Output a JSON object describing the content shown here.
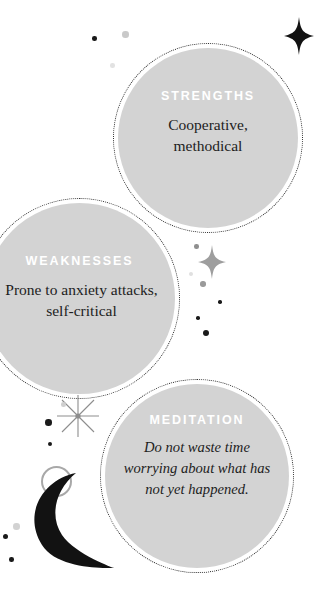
{
  "canvas": {
    "width": 318,
    "height": 590,
    "background": "#ffffff"
  },
  "theme": {
    "bubble_fill": "#d3d3d3",
    "bubble_ring": "#2b2b2b",
    "heading_color": "#ffffff",
    "body_color": "#1d1d1d",
    "ink_black": "#121212",
    "grey_mid": "#a8a8a8",
    "grey_light": "#d9d9d9"
  },
  "bubbles": [
    {
      "id": "strengths",
      "heading": "STRENGTHS",
      "body_line1": "Cooperative,",
      "body_line2": "methodical",
      "style": "roman"
    },
    {
      "id": "weaknesses",
      "heading": "WEAKNESSES",
      "body_line1": "Prone to anxiety attacks,",
      "body_line2": "self-critical",
      "style": "roman"
    },
    {
      "id": "meditation",
      "heading": "MEDITATION",
      "body_line1": "Do not waste time",
      "body_line2": "worrying about what has",
      "body_line3": "not yet happened.",
      "style": "italic"
    }
  ],
  "decorations": {
    "sparkle_top_right": "four-point-star-icon",
    "sparkle_mid_right": "four-point-star-icon",
    "starburst_lower_left": "eight-point-starburst-icon",
    "crescent": "crescent-moon-icon",
    "ring": "circle-outline-icon",
    "dots": [
      {
        "x": 92,
        "y": 36,
        "size": 4.5,
        "color": "#1a1a1a"
      },
      {
        "x": 122,
        "y": 31,
        "size": 6.5,
        "color": "#c9c9c9"
      },
      {
        "x": 110,
        "y": 63,
        "size": 4.5,
        "color": "#e2e2e2"
      },
      {
        "x": 194,
        "y": 244,
        "size": 4.5,
        "color": "#8f8f8f"
      },
      {
        "x": 189,
        "y": 272,
        "size": 4.0,
        "color": "#e0e0e0"
      },
      {
        "x": 200,
        "y": 281,
        "size": 5.5,
        "color": "#9a9a9a"
      },
      {
        "x": 218,
        "y": 300,
        "size": 3.5,
        "color": "#1a1a1a"
      },
      {
        "x": 196,
        "y": 316,
        "size": 3.5,
        "color": "#1a1a1a"
      },
      {
        "x": 203,
        "y": 330,
        "size": 6.0,
        "color": "#1a1a1a"
      },
      {
        "x": 61,
        "y": 402,
        "size": 4.5,
        "color": "#cfcfcf"
      },
      {
        "x": 45,
        "y": 419,
        "size": 6.5,
        "color": "#1a1a1a"
      },
      {
        "x": 48,
        "y": 442,
        "size": 4.0,
        "color": "#1a1a1a"
      },
      {
        "x": 13,
        "y": 523,
        "size": 6.5,
        "color": "#d2d2d2"
      },
      {
        "x": 3,
        "y": 534,
        "size": 5.0,
        "color": "#1a1a1a"
      },
      {
        "x": 9,
        "y": 557,
        "size": 4.5,
        "color": "#1a1a1a"
      }
    ]
  }
}
